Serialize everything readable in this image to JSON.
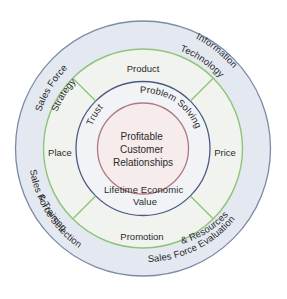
{
  "diagram": {
    "center": {
      "lines": [
        "Profitable",
        "Customer",
        "Relationships"
      ]
    },
    "relationship_ring": {
      "trust": "Trust",
      "problem_solving": "Problem Solving",
      "lifetime_value": "Lifetime Economic Value"
    },
    "marketing_mix": {
      "product": "Product",
      "price": "Price",
      "promotion": "Promotion",
      "place": "Place"
    },
    "sales_force_ring": {
      "strategy": "Sales Force Strategy",
      "strategy_line1": "Sales Force",
      "strategy_line2": "Strategy",
      "it": "Information Technology",
      "it_line1": "Information",
      "it_line2": "Technology",
      "selection": "Sales Force Selection & Training",
      "selection_line1": "Sales Force Selection",
      "selection_line2": "& Training",
      "evaluation": "Sales Force Evaluation & Resources",
      "evaluation_line1": "Sales Force Evaluation",
      "evaluation_line2": "& Resources"
    },
    "colors": {
      "outer_fill": "#e4e9f1",
      "outer_stroke": "#7d8aa6",
      "mix_fill": "#f1f4ee",
      "mix_stroke": "#8fc47c",
      "relationship_fill": "#f1f3f6",
      "relationship_stroke": "#4b5a85",
      "core_fill": "#f6ecec",
      "core_stroke": "#b07a82"
    }
  }
}
